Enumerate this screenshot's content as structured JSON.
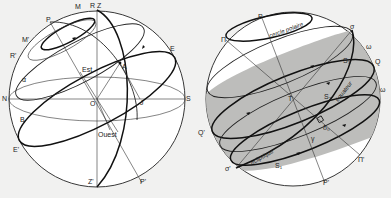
{
  "figure": {
    "left_sphere": {
      "name": "local horizon celestial sphere",
      "labels": {
        "zenith": "Z",
        "nadir": "Z'",
        "R": "R",
        "R_prime": "R'",
        "M": "M",
        "M_prime": "M'",
        "pole": "P",
        "pole_prime": "P'",
        "east": "Est",
        "west": "Ouest",
        "north": "N",
        "south": "S",
        "center": "O",
        "A": "A",
        "B": "B",
        "E": "E",
        "E_prime": "E'",
        "J": "J",
        "alpha": "α"
      }
    },
    "right_sphere": {
      "name": "ecliptic and equator sphere",
      "labels": {
        "pole": "P",
        "pole_prime": "P'",
        "pi": "Π",
        "pi_prime": "Π'",
        "sigma": "σ",
        "sigma_prime": "σ'",
        "omega": "ω",
        "omega_2": "ω",
        "Q": "Q",
        "Q_prime": "Q'",
        "center": "T",
        "S1": "S₁",
        "S2": "S₂",
        "S3": "S₃",
        "s0": "δ₀",
        "gamma": "γ",
        "polar_circle": "cercle polaire",
        "equator": "équateur",
        "ecliptic": "écliptique"
      },
      "shade_color": "#b9b9b7"
    }
  }
}
